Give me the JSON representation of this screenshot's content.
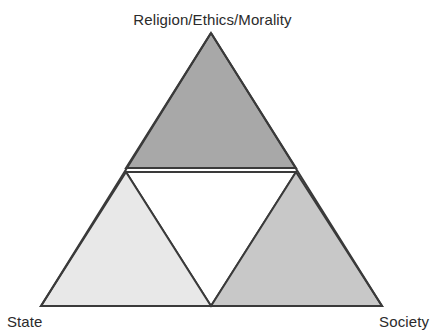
{
  "diagram": {
    "type": "triangle-venn",
    "title": "",
    "background_color": "#ffffff",
    "stroke_color": "#3a3a3a",
    "stroke_width": 2,
    "labels": {
      "apex": "Religion/Ethics/Morality",
      "bottom_left": "State",
      "bottom_right": "Society"
    },
    "label_color": "#2b2b2b",
    "regions": [
      {
        "name": "top-triangle",
        "label_ref": "apex",
        "fill": "#a8a8a8",
        "points": "211,33 296,168 126,168"
      },
      {
        "name": "bottom-left-triangle",
        "label_ref": "bottom_left",
        "fill": "#e8e8e8",
        "points": "126,172 211,306 41,306"
      },
      {
        "name": "bottom-right-triangle",
        "label_ref": "bottom_right",
        "fill": "#c8c8c8",
        "points": "296,172 382,306 211,306"
      },
      {
        "name": "center-triangle",
        "label_ref": "",
        "fill": "#ffffff",
        "points": "126,172 296,172 211,306"
      }
    ],
    "geometry": {
      "apex": [
        211,
        33
      ],
      "bottom_left": [
        41,
        306
      ],
      "bottom_right": [
        382,
        306
      ],
      "mid_left": [
        126,
        170
      ],
      "mid_right": [
        296,
        170
      ],
      "mid_bottom": [
        211,
        306
      ]
    }
  }
}
